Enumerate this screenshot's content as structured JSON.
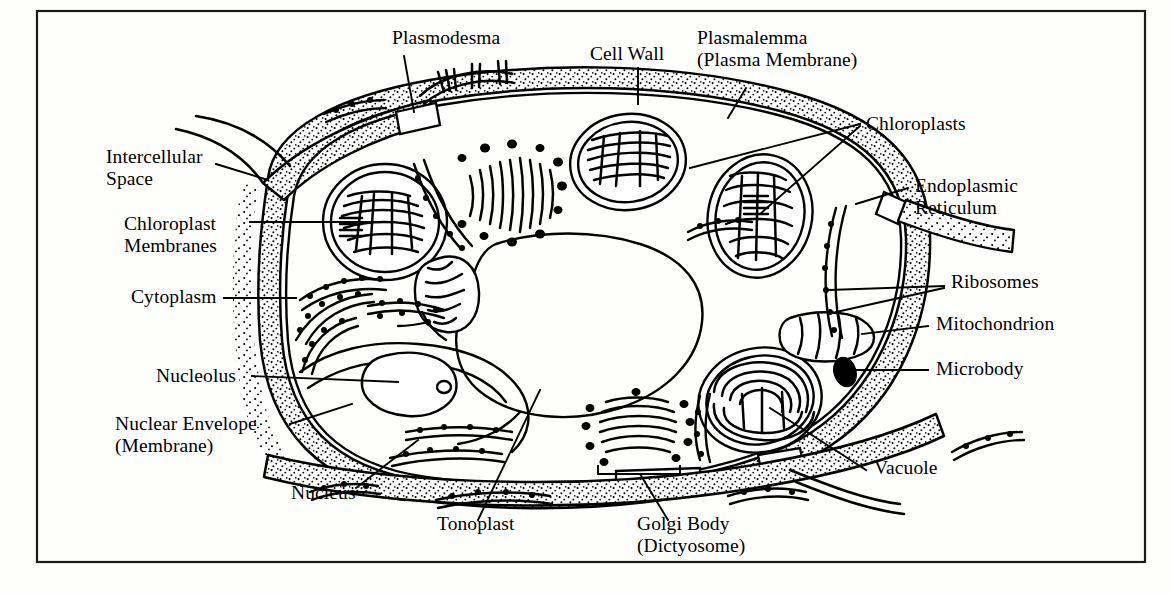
{
  "figure": {
    "style": "black-and-white line drawing with stippled cell wall",
    "background_color": "#fefefd",
    "ink_color": "#000000",
    "border": {
      "present": true,
      "color": "#1a1a1a"
    }
  },
  "labels": [
    {
      "id": "plasmodesma",
      "text": "Plasmodesma",
      "text2": "",
      "x": 392,
      "y": 44,
      "anchor": "start"
    },
    {
      "id": "cell-wall",
      "text": "Cell Wall",
      "text2": "",
      "x": 590,
      "y": 60,
      "anchor": "start"
    },
    {
      "id": "plasmalemma",
      "text": "Plasmalemma",
      "text2": "(Plasma Membrane)",
      "x": 697,
      "y": 44,
      "anchor": "start"
    },
    {
      "id": "chloroplasts",
      "text": "Chloroplasts",
      "text2": "",
      "x": 866,
      "y": 130,
      "anchor": "start"
    },
    {
      "id": "intercellular-space",
      "text": "Intercellular",
      "text2": "Space",
      "x": 106,
      "y": 163,
      "anchor": "start"
    },
    {
      "id": "endoplasmic-reticulum",
      "text": "Endoplasmic",
      "text2": "Reticulum",
      "x": 915,
      "y": 192,
      "anchor": "start"
    },
    {
      "id": "chloroplast-membranes",
      "text": "Chloroplast",
      "text2": "Membranes",
      "x": 124,
      "y": 230,
      "anchor": "start"
    },
    {
      "id": "ribosomes",
      "text": "Ribosomes",
      "text2": "",
      "x": 951,
      "y": 288,
      "anchor": "start"
    },
    {
      "id": "cytoplasm",
      "text": "Cytoplasm",
      "text2": "",
      "x": 131,
      "y": 303,
      "anchor": "start"
    },
    {
      "id": "mitochondrion",
      "text": "Mitochondrion",
      "text2": "",
      "x": 936,
      "y": 330,
      "anchor": "start"
    },
    {
      "id": "microbody",
      "text": "Microbody",
      "text2": "",
      "x": 936,
      "y": 375,
      "anchor": "start"
    },
    {
      "id": "nucleolus",
      "text": "Nucleolus",
      "text2": "",
      "x": 156,
      "y": 382,
      "anchor": "start"
    },
    {
      "id": "nuclear-envelope",
      "text": "Nuclear Envelope",
      "text2": "(Membrane)",
      "x": 115,
      "y": 430,
      "anchor": "start"
    },
    {
      "id": "vacuole",
      "text": "Vacuole",
      "text2": "",
      "x": 874,
      "y": 474,
      "anchor": "start"
    },
    {
      "id": "nucleus",
      "text": "Nucleus",
      "text2": "",
      "x": 291,
      "y": 499,
      "anchor": "start"
    },
    {
      "id": "tonoplast",
      "text": "Tonoplast",
      "text2": "",
      "x": 437,
      "y": 530,
      "anchor": "start"
    },
    {
      "id": "golgi-body",
      "text": "Golgi Body",
      "text2": "(Dictyosome)",
      "x": 637,
      "y": 530,
      "anchor": "start"
    }
  ],
  "structures": [
    {
      "id": "cell-wall",
      "name": "Cell Wall",
      "rendering": "stippled band surrounding the cell"
    },
    {
      "id": "plasmalemma",
      "name": "Plasmalemma",
      "rendering": "line just inside the cell wall"
    },
    {
      "id": "plasmodesma",
      "name": "Plasmodesma",
      "rendering": "channel gap through the cell wall at top"
    },
    {
      "id": "chloroplast-1",
      "name": "Chloroplast",
      "rendering": "oval with double membrane and stacked lamellae"
    },
    {
      "id": "chloroplast-2",
      "name": "Chloroplast",
      "rendering": "oval with double membrane and stacked lamellae"
    },
    {
      "id": "chloroplast-3",
      "name": "Chloroplast",
      "rendering": "oval with double membrane and stacked lamellae"
    },
    {
      "id": "chloroplast-4",
      "name": "Chloroplast",
      "rendering": "oval with double membrane and stacked lamellae"
    },
    {
      "id": "mitochondrion-1",
      "name": "Mitochondrion",
      "rendering": "small oval with internal cristae"
    },
    {
      "id": "mitochondrion-2",
      "name": "Mitochondrion",
      "rendering": "small oval with internal cristae"
    },
    {
      "id": "nucleus",
      "name": "Nucleus",
      "rendering": "large central body bounded by nuclear envelope"
    },
    {
      "id": "nucleolus",
      "name": "Nucleolus",
      "rendering": "rounded body inside the nucleus"
    },
    {
      "id": "vacuole",
      "name": "Vacuole",
      "rendering": "large clear region bounded by tonoplast"
    },
    {
      "id": "golgi-body-1",
      "name": "Golgi Body",
      "rendering": "stack of flattened cisternae with vesicles"
    },
    {
      "id": "golgi-body-2",
      "name": "Golgi Body",
      "rendering": "stack of flattened cisternae with vesicles"
    },
    {
      "id": "endoplasmic-reticulum",
      "name": "Endoplasmic Reticulum",
      "rendering": "curved strands studded with ribosomes"
    },
    {
      "id": "ribosomes",
      "name": "Ribosomes",
      "rendering": "small dots along the ER membranes"
    },
    {
      "id": "microbody",
      "name": "Microbody",
      "rendering": "solid black ellipse"
    },
    {
      "id": "intercellular-space",
      "name": "Intercellular Space",
      "rendering": "gap between adjacent cell walls"
    }
  ]
}
